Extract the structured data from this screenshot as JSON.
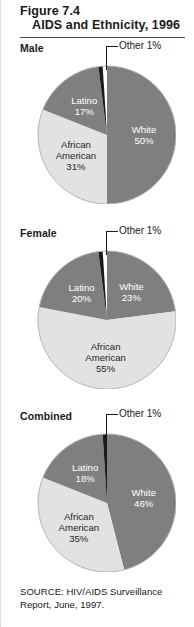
{
  "figure": {
    "number": "Figure 7.4",
    "title": "AIDS and Ethnicity, 1996",
    "source": "SOURCE: HIV/AIDS Surveillance Report, June, 1997."
  },
  "colors": {
    "dark_slice": "#7f7f7f",
    "light_slice": "#e2e2e2",
    "other_slice": "#1a1a1a",
    "rim": "#b5b5b5",
    "text_on_dark": "#ffffff",
    "text_on_light": "#262626",
    "rule": "#4a4a4a"
  },
  "callout": {
    "label": "Other 1%"
  },
  "panels": [
    {
      "label": "Male",
      "slices": [
        {
          "name": "White",
          "percent": 50,
          "label": "White",
          "value_label": "50%",
          "shade": "dark"
        },
        {
          "name": "African American",
          "percent": 31,
          "label": "African\nAmerican",
          "value_label": "31%",
          "shade": "light"
        },
        {
          "name": "Latino",
          "percent": 17,
          "label": "Latino",
          "value_label": "17%",
          "shade": "dark"
        },
        {
          "name": "Other",
          "percent": 1,
          "label": "Other",
          "value_label": "1%",
          "shade": "other"
        }
      ]
    },
    {
      "label": "Female",
      "slices": [
        {
          "name": "White",
          "percent": 23,
          "label": "White",
          "value_label": "23%",
          "shade": "dark"
        },
        {
          "name": "African American",
          "percent": 55,
          "label": "African\nAmerican",
          "value_label": "55%",
          "shade": "light"
        },
        {
          "name": "Latino",
          "percent": 20,
          "label": "Latino",
          "value_label": "20%",
          "shade": "dark"
        },
        {
          "name": "Other",
          "percent": 1,
          "label": "Other",
          "value_label": "1%",
          "shade": "other"
        }
      ]
    },
    {
      "label": "Combined",
      "slices": [
        {
          "name": "White",
          "percent": 46,
          "label": "White",
          "value_label": "46%",
          "shade": "dark"
        },
        {
          "name": "African American",
          "percent": 35,
          "label": "African\nAmerican",
          "value_label": "35%",
          "shade": "light"
        },
        {
          "name": "Latino",
          "percent": 18,
          "label": "Latino",
          "value_label": "18%",
          "shade": "dark"
        },
        {
          "name": "Other",
          "percent": 1,
          "label": "Other",
          "value_label": "1%",
          "shade": "other"
        }
      ]
    }
  ],
  "chart_data": [
    {
      "type": "pie",
      "title": "Male",
      "categories": [
        "White",
        "African American",
        "Latino",
        "Other"
      ],
      "values": [
        50,
        31,
        17,
        1
      ],
      "unit": "percent",
      "annotations": [
        "Other 1%"
      ],
      "legend": "none"
    },
    {
      "type": "pie",
      "title": "Female",
      "categories": [
        "White",
        "African American",
        "Latino",
        "Other"
      ],
      "values": [
        23,
        55,
        20,
        1
      ],
      "unit": "percent",
      "annotations": [
        "Other 1%"
      ],
      "legend": "none"
    },
    {
      "type": "pie",
      "title": "Combined",
      "categories": [
        "White",
        "African American",
        "Latino",
        "Other"
      ],
      "values": [
        46,
        35,
        18,
        1
      ],
      "unit": "percent",
      "annotations": [
        "Other 1%"
      ],
      "legend": "none"
    }
  ]
}
